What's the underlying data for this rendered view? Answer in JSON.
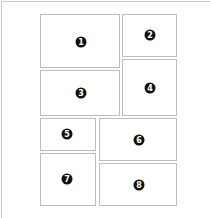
{
  "layout": {
    "panels": [
      {
        "label": "1",
        "x": 40,
        "y": 14,
        "w": 80,
        "h": 54,
        "badge_x": 40,
        "badge_y": 27
      },
      {
        "label": "2",
        "x": 122,
        "y": 14,
        "w": 55,
        "h": 43,
        "badge_x": 27,
        "badge_y": 20
      },
      {
        "label": "3",
        "x": 40,
        "y": 70,
        "w": 80,
        "h": 46,
        "badge_x": 40,
        "badge_y": 22
      },
      {
        "label": "4",
        "x": 122,
        "y": 59,
        "w": 55,
        "h": 57,
        "badge_x": 27,
        "badge_y": 28
      },
      {
        "label": "5",
        "x": 40,
        "y": 118,
        "w": 56,
        "h": 33,
        "badge_x": 26,
        "badge_y": 15
      },
      {
        "label": "6",
        "x": 99,
        "y": 118,
        "w": 78,
        "h": 43,
        "badge_x": 39,
        "badge_y": 21
      },
      {
        "label": "7",
        "x": 40,
        "y": 153,
        "w": 56,
        "h": 53,
        "badge_x": 26,
        "badge_y": 25
      },
      {
        "label": "8",
        "x": 99,
        "y": 163,
        "w": 78,
        "h": 43,
        "badge_x": 39,
        "badge_y": 21
      }
    ]
  },
  "colors": {
    "border": "#bdbdbd",
    "badge": "#111111",
    "badge_text": "#ffffff"
  }
}
